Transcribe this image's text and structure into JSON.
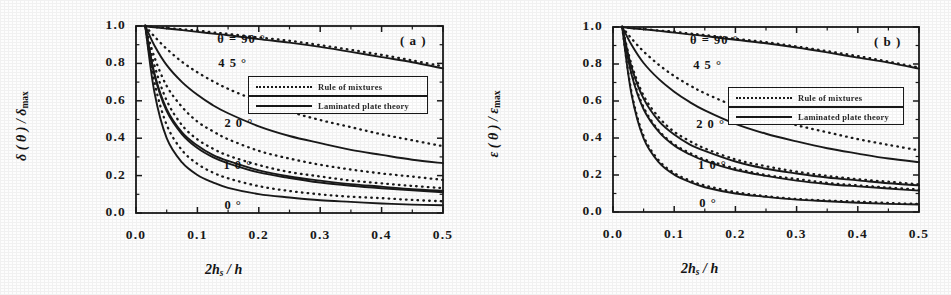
{
  "figure": {
    "background": "#fdfdfd",
    "ink": "#1a1a1a"
  },
  "panels": [
    {
      "id": "a",
      "panel_label": "( a )",
      "ytitle_main": "δ ( θ ) / δ",
      "ytitle_sub": "max",
      "xtitle_pre": "2",
      "xtitle_h": "h",
      "xtitle_sub": "s",
      "xtitle_post": "/ h",
      "yticks": [
        "1.0",
        "0.8",
        "0.6",
        "0.4",
        "0.2",
        "0.0"
      ],
      "xticks": [
        "0.0",
        "0.1",
        "0.2",
        "0.3",
        "0.4",
        "0.5"
      ],
      "curve_labels": [
        {
          "text": "θ = 90 °",
          "x": 0.265,
          "y": 0.925
        },
        {
          "text": "4 5 °",
          "x": 0.268,
          "y": 0.795
        },
        {
          "text": "2 0 °",
          "x": 0.288,
          "y": 0.475
        },
        {
          "text": "1 0 °",
          "x": 0.285,
          "y": 0.252
        },
        {
          "text": "0 °",
          "x": 0.288,
          "y": 0.035
        }
      ],
      "legend": {
        "entries": [
          {
            "label": "Rule of mixtures",
            "style": "dotted"
          },
          {
            "label": "Laminated plate theory",
            "style": "solid"
          }
        ]
      }
    },
    {
      "id": "b",
      "panel_label": "( b )",
      "ytitle_main": "ε ( θ ) / ε",
      "ytitle_sub": "max",
      "xtitle_pre": "2",
      "xtitle_h": "h",
      "xtitle_sub": "s",
      "xtitle_post": "/ h",
      "yticks": [
        "1.0",
        "0.8",
        "0.6",
        "0.4",
        "0.2",
        "0.0"
      ],
      "xticks": [
        "0.0",
        "0.1",
        "0.2",
        "0.3",
        "0.4",
        "0.5"
      ],
      "curve_labels": [
        {
          "text": "θ = 90 °",
          "x": 0.252,
          "y": 0.925
        },
        {
          "text": "4 5 °",
          "x": 0.262,
          "y": 0.79
        },
        {
          "text": "2 0 °",
          "x": 0.272,
          "y": 0.47
        },
        {
          "text": "1 0 °",
          "x": 0.278,
          "y": 0.25
        },
        {
          "text": "0 °",
          "x": 0.282,
          "y": 0.045
        }
      ],
      "legend": {
        "entries": [
          {
            "label": "Rule of mixtures",
            "style": "dotted"
          },
          {
            "label": "Laminated plate theory",
            "style": "solid"
          }
        ]
      }
    }
  ],
  "chart_data": [
    {
      "type": "line",
      "title": "( a )",
      "xlabel": "2 h_s / h",
      "ylabel": "δ(θ) / δ_max",
      "xlim": [
        0.0,
        0.5
      ],
      "ylim": [
        0.0,
        1.0
      ],
      "xticks": [
        0.0,
        0.1,
        0.2,
        0.3,
        0.4,
        0.5
      ],
      "yticks": [
        0.0,
        0.2,
        0.4,
        0.6,
        0.8,
        1.0
      ],
      "grid": false,
      "legend_position": "upper-center-right",
      "x": [
        0.015,
        0.03,
        0.05,
        0.075,
        0.1,
        0.125,
        0.15,
        0.2,
        0.25,
        0.3,
        0.35,
        0.4,
        0.45,
        0.5
      ],
      "series": [
        {
          "name": "θ = 90° — Rule of mixtures",
          "angle": 90,
          "style": "dotted",
          "values": [
            1.0,
            0.995,
            0.99,
            0.983,
            0.975,
            0.967,
            0.958,
            0.94,
            0.92,
            0.897,
            0.872,
            0.845,
            0.815,
            0.783
          ]
        },
        {
          "name": "θ = 90° — Laminated plate theory",
          "angle": 90,
          "style": "solid",
          "values": [
            1.0,
            0.993,
            0.985,
            0.977,
            0.968,
            0.959,
            0.95,
            0.931,
            0.91,
            0.887,
            0.862,
            0.835,
            0.805,
            0.772
          ]
        },
        {
          "name": "θ = 45° — Rule of mixtures",
          "angle": 45,
          "style": "dotted",
          "values": [
            1.0,
            0.945,
            0.878,
            0.808,
            0.752,
            0.705,
            0.664,
            0.597,
            0.543,
            0.498,
            0.458,
            0.422,
            0.389,
            0.358
          ]
        },
        {
          "name": "θ = 45° — Laminated plate theory",
          "angle": 45,
          "style": "solid",
          "values": [
            1.0,
            0.895,
            0.79,
            0.7,
            0.632,
            0.578,
            0.534,
            0.465,
            0.413,
            0.372,
            0.338,
            0.31,
            0.286,
            0.265
          ]
        },
        {
          "name": "θ = 20° — Rule of mixtures",
          "angle": 20,
          "style": "dotted",
          "values": [
            1.0,
            0.833,
            0.68,
            0.566,
            0.49,
            0.436,
            0.394,
            0.333,
            0.29,
            0.258,
            0.233,
            0.212,
            0.194,
            0.178
          ]
        },
        {
          "name": "θ = 20° — Laminated plate theory",
          "angle": 20,
          "style": "solid",
          "values": [
            1.0,
            0.745,
            0.555,
            0.432,
            0.36,
            0.312,
            0.277,
            0.228,
            0.196,
            0.173,
            0.155,
            0.14,
            0.128,
            0.118
          ]
        },
        {
          "name": "θ = 10° — Rule of mixtures",
          "angle": 10,
          "style": "dotted",
          "values": [
            1.0,
            0.79,
            0.6,
            0.47,
            0.395,
            0.345,
            0.307,
            0.255,
            0.22,
            0.194,
            0.174,
            0.158,
            0.144,
            0.133
          ]
        },
        {
          "name": "θ = 10° — Laminated plate theory",
          "angle": 10,
          "style": "solid",
          "values": [
            1.0,
            0.74,
            0.545,
            0.42,
            0.348,
            0.3,
            0.266,
            0.218,
            0.187,
            0.164,
            0.147,
            0.133,
            0.122,
            0.112
          ]
        },
        {
          "name": "θ = 0° — Rule of mixtures",
          "angle": 0,
          "style": "dotted",
          "values": [
            1.0,
            0.7,
            0.47,
            0.335,
            0.262,
            0.216,
            0.184,
            0.143,
            0.118,
            0.101,
            0.088,
            0.078,
            0.07,
            0.064
          ]
        },
        {
          "name": "θ = 0° — Laminated plate theory",
          "angle": 0,
          "style": "solid",
          "values": [
            1.0,
            0.645,
            0.4,
            0.27,
            0.203,
            0.163,
            0.136,
            0.102,
            0.082,
            0.069,
            0.059,
            0.052,
            0.046,
            0.042
          ]
        }
      ]
    },
    {
      "type": "line",
      "title": "( b )",
      "xlabel": "2 h_s / h",
      "ylabel": "ε(θ) / ε_max",
      "xlim": [
        0.0,
        0.5
      ],
      "ylim": [
        0.0,
        1.0
      ],
      "xticks": [
        0.0,
        0.1,
        0.2,
        0.3,
        0.4,
        0.5
      ],
      "yticks": [
        0.0,
        0.2,
        0.4,
        0.6,
        0.8,
        1.0
      ],
      "grid": false,
      "legend_position": "upper-center-right",
      "x": [
        0.015,
        0.03,
        0.05,
        0.075,
        0.1,
        0.125,
        0.15,
        0.2,
        0.25,
        0.3,
        0.35,
        0.4,
        0.45,
        0.5
      ],
      "series": [
        {
          "name": "θ = 90° — Rule of mixtures",
          "angle": 90,
          "style": "dotted",
          "values": [
            1.0,
            0.995,
            0.989,
            0.982,
            0.974,
            0.966,
            0.957,
            0.938,
            0.917,
            0.894,
            0.869,
            0.842,
            0.812,
            0.78
          ]
        },
        {
          "name": "θ = 90° — Laminated plate theory",
          "angle": 90,
          "style": "solid",
          "values": [
            1.0,
            0.993,
            0.986,
            0.978,
            0.969,
            0.96,
            0.951,
            0.932,
            0.911,
            0.888,
            0.863,
            0.836,
            0.806,
            0.774
          ]
        },
        {
          "name": "θ = 45° — Rule of mixtures",
          "angle": 45,
          "style": "dotted",
          "values": [
            1.0,
            0.94,
            0.868,
            0.795,
            0.735,
            0.685,
            0.642,
            0.572,
            0.516,
            0.47,
            0.43,
            0.395,
            0.363,
            0.334
          ]
        },
        {
          "name": "θ = 45° — Laminated plate theory",
          "angle": 45,
          "style": "solid",
          "values": [
            1.0,
            0.905,
            0.805,
            0.718,
            0.65,
            0.596,
            0.55,
            0.478,
            0.424,
            0.38,
            0.345,
            0.315,
            0.29,
            0.268
          ]
        },
        {
          "name": "θ = 20° — Rule of mixtures",
          "angle": 20,
          "style": "dotted",
          "values": [
            1.0,
            0.8,
            0.63,
            0.51,
            0.435,
            0.383,
            0.343,
            0.285,
            0.246,
            0.218,
            0.196,
            0.178,
            0.163,
            0.15
          ]
        },
        {
          "name": "θ = 20° — Laminated plate theory",
          "angle": 20,
          "style": "solid",
          "values": [
            1.0,
            0.785,
            0.612,
            0.492,
            0.418,
            0.367,
            0.329,
            0.273,
            0.235,
            0.208,
            0.187,
            0.17,
            0.156,
            0.143
          ]
        },
        {
          "name": "θ = 10° — Rule of mixtures",
          "angle": 10,
          "style": "dotted",
          "values": [
            1.0,
            0.755,
            0.565,
            0.44,
            0.368,
            0.32,
            0.284,
            0.234,
            0.201,
            0.177,
            0.158,
            0.143,
            0.131,
            0.121
          ]
        },
        {
          "name": "θ = 10° — Laminated plate theory",
          "angle": 10,
          "style": "solid",
          "values": [
            1.0,
            0.748,
            0.556,
            0.432,
            0.36,
            0.313,
            0.277,
            0.228,
            0.195,
            0.171,
            0.153,
            0.139,
            0.127,
            0.117
          ]
        },
        {
          "name": "θ = 0° — Rule of mixtures",
          "angle": 0,
          "style": "dotted",
          "values": [
            1.0,
            0.652,
            0.41,
            0.278,
            0.21,
            0.17,
            0.142,
            0.107,
            0.086,
            0.072,
            0.063,
            0.055,
            0.049,
            0.045
          ]
        },
        {
          "name": "θ = 0° — Laminated plate theory",
          "angle": 0,
          "style": "solid",
          "values": [
            1.0,
            0.64,
            0.398,
            0.268,
            0.202,
            0.162,
            0.135,
            0.101,
            0.081,
            0.068,
            0.058,
            0.051,
            0.045,
            0.041
          ]
        }
      ]
    }
  ]
}
